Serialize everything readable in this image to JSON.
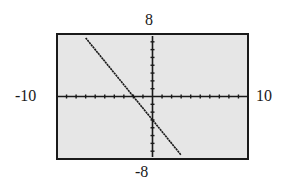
{
  "panel_label": ")",
  "window": {
    "xmin": "-10",
    "xmax": "10",
    "ymin": "-8",
    "ymax": "8"
  },
  "colors": {
    "screen_bg": "#e6e6e6",
    "axis": "#1a1a1a",
    "line": "#1a1a1a",
    "border": "#1a1a1a"
  },
  "chart_data": {
    "type": "line",
    "title": "",
    "xlabel": "",
    "ylabel": "",
    "xlim": [
      -10,
      10
    ],
    "ylim": [
      -8,
      8
    ],
    "xscale": 1,
    "yscale": 1,
    "grid": false,
    "tick_labels": {
      "x_left": "-10",
      "x_right": "10",
      "y_top": "8",
      "y_bottom": "-8"
    },
    "series": [
      {
        "name": "y = -1.5x - 3",
        "equation": "y = -1.5x - 3",
        "slope": -1.5,
        "intercept": -3,
        "x_intercept": -2,
        "x": [
          -7,
          -6,
          -4,
          -2,
          0,
          2,
          3
        ],
        "values": [
          7.5,
          6,
          3,
          0,
          -3,
          -6,
          -7.5
        ]
      }
    ]
  }
}
